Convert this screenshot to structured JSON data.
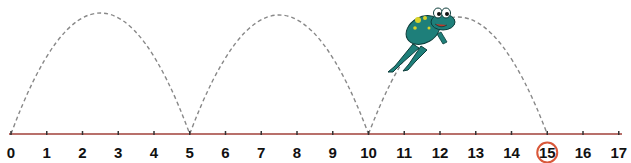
{
  "caption": {
    "text": "",
    "note": "top caption cut off; only descenders visible"
  },
  "number_line": {
    "min": 0,
    "max": 17,
    "ticks": [
      "0",
      "1",
      "2",
      "3",
      "4",
      "5",
      "6",
      "7",
      "8",
      "9",
      "10",
      "11",
      "12",
      "13",
      "14",
      "15",
      "16",
      "17"
    ],
    "axis_color": "#a0403a",
    "highlighted_value": "15",
    "highlight_color": "#d9583a"
  },
  "jumps": [
    {
      "from": 0,
      "to": 5
    },
    {
      "from": 5,
      "to": 10
    },
    {
      "from": 10,
      "to": 15
    }
  ],
  "jump_style": {
    "color": "#888888",
    "dashed": true
  },
  "character": {
    "name": "frog",
    "body_color": "#1e7f7a",
    "spot_color": "#d8d22a",
    "position_over_jump": 3
  }
}
